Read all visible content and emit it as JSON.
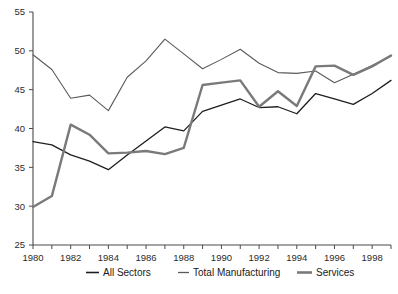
{
  "chart_data": {
    "type": "line",
    "title": "",
    "subtitle": "",
    "xlabel": "",
    "ylabel": "",
    "xlim": [
      1980,
      1999
    ],
    "ylim": [
      25,
      55
    ],
    "yticks": [
      25,
      30,
      35,
      40,
      45,
      50,
      55
    ],
    "xticks": [
      1980,
      1982,
      1984,
      1986,
      1988,
      1990,
      1992,
      1994,
      1996,
      1998
    ],
    "xtick_labels": [
      "1980",
      "1982",
      "1984",
      "1986",
      "1988",
      "1990",
      "1992",
      "1994",
      "1996",
      "1998"
    ],
    "ytick_labels": [
      "25",
      "30",
      "35",
      "40",
      "45",
      "50",
      "55"
    ],
    "minor_xticks": [
      1980,
      1981,
      1982,
      1983,
      1984,
      1985,
      1986,
      1987,
      1988,
      1989,
      1990,
      1991,
      1992,
      1993,
      1994,
      1995,
      1996,
      1997,
      1998,
      1999
    ],
    "grid": false,
    "legend_position": "bottom",
    "x": [
      1980,
      1981,
      1982,
      1983,
      1984,
      1985,
      1986,
      1987,
      1988,
      1989,
      1990,
      1991,
      1992,
      1993,
      1994,
      1995,
      1996,
      1997,
      1998,
      1999
    ],
    "series": [
      {
        "name": "All Sectors",
        "color": "#1e1e1e",
        "width": 1.3,
        "values": [
          38.3,
          37.9,
          36.6,
          35.8,
          34.7,
          36.6,
          38.4,
          40.2,
          39.7,
          42.2,
          43.0,
          43.8,
          42.7,
          42.8,
          41.9,
          44.5,
          43.8,
          43.1,
          44.5,
          46.2
        ]
      },
      {
        "name": "Total Manufacturing",
        "color": "#5a5a5a",
        "width": 1.1,
        "values": [
          49.5,
          47.6,
          43.9,
          44.3,
          42.3,
          46.6,
          48.7,
          51.5,
          49.6,
          47.7,
          48.9,
          50.2,
          48.4,
          47.2,
          47.1,
          47.4,
          45.9,
          47.0,
          48.1,
          49.3
        ]
      },
      {
        "name": "Services",
        "color": "#7a7a7a",
        "width": 2.4,
        "values": [
          29.9,
          31.3,
          40.5,
          39.2,
          36.8,
          36.9,
          37.1,
          36.7,
          37.5,
          45.6,
          45.9,
          46.2,
          42.8,
          44.8,
          42.9,
          48.0,
          48.1,
          46.9,
          48.0,
          49.4
        ]
      }
    ]
  },
  "legend": {
    "items": [
      {
        "label": "All Sectors",
        "color": "#1e1e1e",
        "width": 1.6
      },
      {
        "label": "Total Manufacturing",
        "color": "#5a5a5a",
        "width": 1.3
      },
      {
        "label": "Services",
        "color": "#7a7a7a",
        "width": 2.6
      }
    ]
  }
}
